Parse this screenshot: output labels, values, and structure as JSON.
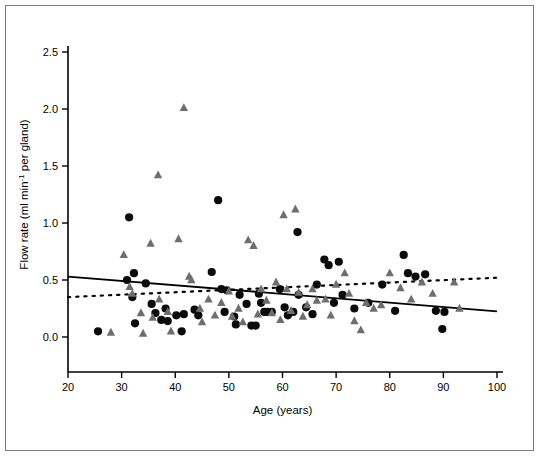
{
  "chart_data": {
    "type": "scatter",
    "title": "",
    "xlabel": "Age (years)",
    "ylabel": "Flow rate (ml min<sup>-1</sup> per gland)",
    "ylabel_main": "Flow rate (ml min",
    "ylabel_sup": "-1",
    "ylabel_tail": " per gland)",
    "xlim": [
      20,
      100
    ],
    "ylim": [
      0.0,
      2.5
    ],
    "xticks": [
      20,
      30,
      40,
      50,
      60,
      70,
      80,
      90,
      100
    ],
    "xtick_labels": [
      "20",
      "30",
      "40",
      "50",
      "60",
      "70",
      "80",
      "90",
      "100"
    ],
    "yticks": [
      0.0,
      0.5,
      1.0,
      1.5,
      2.0,
      2.5
    ],
    "ytick_labels": [
      "0.0",
      "0.5",
      "1.0",
      "1.5",
      "2.0",
      "2.5"
    ],
    "grid": false,
    "legend_position": "none",
    "series": [
      {
        "name": "circles",
        "marker": "circle",
        "color": "#0b0b0b",
        "points": [
          [
            25.6,
            0.05
          ],
          [
            31.4,
            1.05
          ],
          [
            31.0,
            0.5
          ],
          [
            32.3,
            0.56
          ],
          [
            32.0,
            0.35
          ],
          [
            32.5,
            0.12
          ],
          [
            34.5,
            0.47
          ],
          [
            35.6,
            0.29
          ],
          [
            36.3,
            0.21
          ],
          [
            37.4,
            0.15
          ],
          [
            38.2,
            0.25
          ],
          [
            38.6,
            0.14
          ],
          [
            40.2,
            0.19
          ],
          [
            41.6,
            0.2
          ],
          [
            41.2,
            0.05
          ],
          [
            43.6,
            0.24
          ],
          [
            44.3,
            0.19
          ],
          [
            46.8,
            0.57
          ],
          [
            48.0,
            1.2
          ],
          [
            48.6,
            0.42
          ],
          [
            49.6,
            0.41
          ],
          [
            49.2,
            0.22
          ],
          [
            51.0,
            0.18
          ],
          [
            51.3,
            0.11
          ],
          [
            52.0,
            0.37
          ],
          [
            53.3,
            0.29
          ],
          [
            54.2,
            0.1
          ],
          [
            55.0,
            0.1
          ],
          [
            55.6,
            0.38
          ],
          [
            56.0,
            0.3
          ],
          [
            56.6,
            0.22
          ],
          [
            57.2,
            0.22
          ],
          [
            58.0,
            0.22
          ],
          [
            59.5,
            0.42
          ],
          [
            60.4,
            0.26
          ],
          [
            61.0,
            0.19
          ],
          [
            62.0,
            0.22
          ],
          [
            62.8,
            0.92
          ],
          [
            63.0,
            0.37
          ],
          [
            64.4,
            0.26
          ],
          [
            65.6,
            0.2
          ],
          [
            66.4,
            0.46
          ],
          [
            67.8,
            0.68
          ],
          [
            68.6,
            0.63
          ],
          [
            69.6,
            0.3
          ],
          [
            70.5,
            0.66
          ],
          [
            71.2,
            0.37
          ],
          [
            73.4,
            0.25
          ],
          [
            76.0,
            0.3
          ],
          [
            78.6,
            0.46
          ],
          [
            81.0,
            0.23
          ],
          [
            82.6,
            0.72
          ],
          [
            83.4,
            0.56
          ],
          [
            84.8,
            0.53
          ],
          [
            86.6,
            0.55
          ],
          [
            88.6,
            0.23
          ],
          [
            89.8,
            0.07
          ],
          [
            90.2,
            0.22
          ]
        ]
      },
      {
        "name": "triangles",
        "marker": "triangle",
        "color": "#6e6e6e",
        "points": [
          [
            28.0,
            0.04
          ],
          [
            30.4,
            0.72
          ],
          [
            31.5,
            0.44
          ],
          [
            32.0,
            0.38
          ],
          [
            33.6,
            0.21
          ],
          [
            34.0,
            0.03
          ],
          [
            35.4,
            0.82
          ],
          [
            35.8,
            0.17
          ],
          [
            36.8,
            1.42
          ],
          [
            37.0,
            0.33
          ],
          [
            38.6,
            0.22
          ],
          [
            39.2,
            0.05
          ],
          [
            40.6,
            0.86
          ],
          [
            41.6,
            2.01
          ],
          [
            42.6,
            0.53
          ],
          [
            43.0,
            0.5
          ],
          [
            44.6,
            0.25
          ],
          [
            45.0,
            0.13
          ],
          [
            46.2,
            0.33
          ],
          [
            47.4,
            0.19
          ],
          [
            48.6,
            0.3
          ],
          [
            50.0,
            0.4
          ],
          [
            50.6,
            0.18
          ],
          [
            51.8,
            0.25
          ],
          [
            52.6,
            0.13
          ],
          [
            53.6,
            0.85
          ],
          [
            54.6,
            0.8
          ],
          [
            55.4,
            0.2
          ],
          [
            56.0,
            0.42
          ],
          [
            57.0,
            0.32
          ],
          [
            58.0,
            0.21
          ],
          [
            58.8,
            0.48
          ],
          [
            59.6,
            0.15
          ],
          [
            60.2,
            1.07
          ],
          [
            60.8,
            0.42
          ],
          [
            61.6,
            0.23
          ],
          [
            62.4,
            1.12
          ],
          [
            63.0,
            0.39
          ],
          [
            63.8,
            0.18
          ],
          [
            64.6,
            0.28
          ],
          [
            65.6,
            0.42
          ],
          [
            66.4,
            0.32
          ],
          [
            68.0,
            0.33
          ],
          [
            69.0,
            0.19
          ],
          [
            70.0,
            0.46
          ],
          [
            71.6,
            0.56
          ],
          [
            72.4,
            0.38
          ],
          [
            73.4,
            0.14
          ],
          [
            74.6,
            0.06
          ],
          [
            75.6,
            0.3
          ],
          [
            77.0,
            0.25
          ],
          [
            78.4,
            0.28
          ],
          [
            80.0,
            0.56
          ],
          [
            82.0,
            0.43
          ],
          [
            84.0,
            0.33
          ],
          [
            86.0,
            0.48
          ],
          [
            88.0,
            0.38
          ],
          [
            92.0,
            0.48
          ],
          [
            93.0,
            0.25
          ]
        ]
      }
    ],
    "trendlines": [
      {
        "name": "solid-regression-line",
        "style": "solid",
        "color": "#000000",
        "x_start": 20,
        "y_start": 0.53,
        "x_end": 100,
        "y_end": 0.225
      },
      {
        "name": "dotted-regression-line",
        "style": "dotted",
        "color": "#000000",
        "x_start": 20,
        "y_start": 0.35,
        "x_end": 100,
        "y_end": 0.52
      }
    ]
  }
}
